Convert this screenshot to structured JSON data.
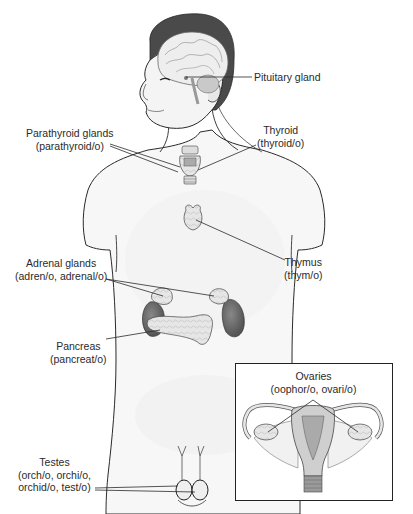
{
  "diagram": {
    "labels": {
      "pituitary": {
        "name": "Pituitary gland"
      },
      "parathyroid": {
        "name": "Parathyroid glands",
        "combining_forms": "(parathyroid/o)"
      },
      "thyroid": {
        "name": "Thyroid",
        "combining_forms": "(thyroid/o)"
      },
      "thymus": {
        "name": "Thymus",
        "combining_forms": "(thym/o)"
      },
      "adrenal": {
        "name": "Adrenal glands",
        "combining_forms": "(adren/o, adrenal/o)"
      },
      "pancreas": {
        "name": "Pancreas",
        "combining_forms": "(pancreat/o)"
      },
      "testes": {
        "name": "Testes",
        "combining_forms_line1": "(orch/o, orchi/o,",
        "combining_forms_line2": "orchid/o, test/o)"
      },
      "ovaries": {
        "name": "Ovaries",
        "combining_forms": "(oophor/o, ovari/o)"
      }
    },
    "colors": {
      "outline": "#2a2a2a",
      "hair": "#4a4a4a",
      "kidney": "#6e6e6e",
      "gland_fill": "#e2e2e2",
      "skin": "#f6f6f6"
    }
  }
}
